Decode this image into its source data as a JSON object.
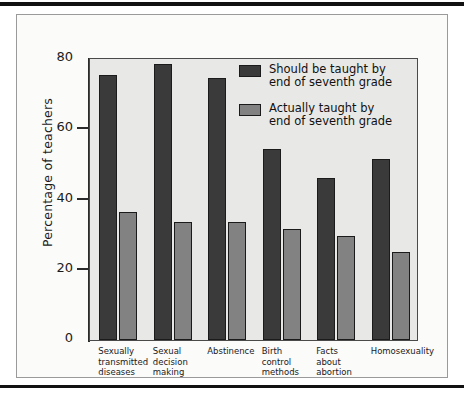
{
  "chart_data": {
    "type": "bar",
    "title": "",
    "subtitle": "",
    "xlabel": "",
    "ylabel": "Percentage of teachers",
    "ylim": [
      0,
      80
    ],
    "yticks": [
      0,
      20,
      40,
      60,
      80
    ],
    "ytick_labels": [
      "0",
      "20",
      "40",
      "60",
      "80"
    ],
    "grid": false,
    "legend_position": "upper-right-inside",
    "categories": [
      "Sexually\ntransmitted\ndiseases",
      "Sexual\ndecision\nmaking",
      "Abstinence",
      "Birth\ncontrol\nmethods",
      "Facts\nabout\nabortion",
      "Homosexuality"
    ],
    "series": [
      {
        "name": "Should be taught by\nend of seventh grade",
        "color": "#3a3a3a",
        "values": [
          75.5,
          78.5,
          74.5,
          54.5,
          46.0,
          51.5
        ]
      },
      {
        "name": "Actually taught by\nend of seventh grade",
        "color": "#828282",
        "values": [
          36.5,
          33.5,
          33.5,
          31.5,
          29.5,
          25.0
        ]
      }
    ]
  },
  "legend": {
    "items": [
      {
        "label": "Should be taught by\nend of seventh grade",
        "swatch": "dark"
      },
      {
        "label": "Actually taught by\nend of seventh grade",
        "swatch": "light"
      }
    ]
  },
  "axis": {
    "y_title": "Percentage of teachers"
  }
}
